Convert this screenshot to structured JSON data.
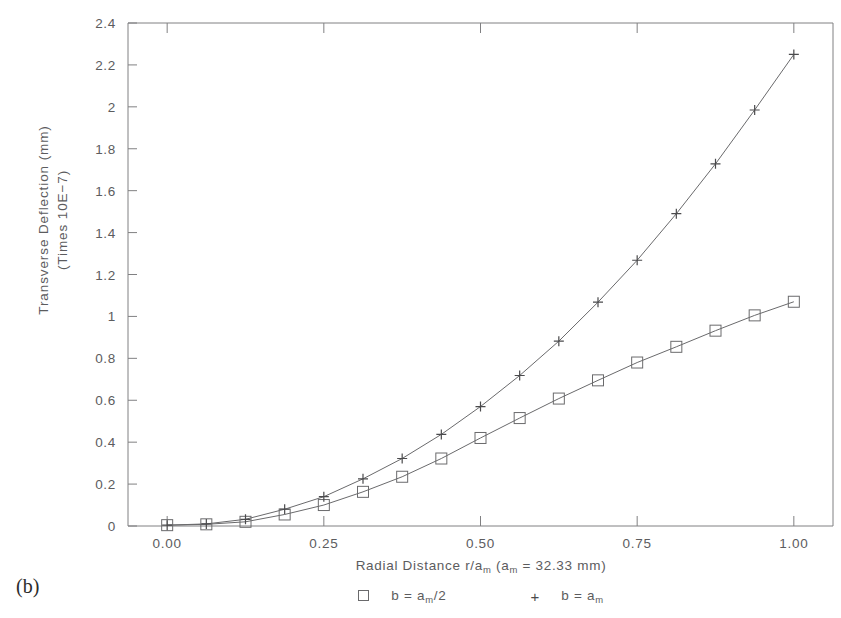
{
  "figure": {
    "panel_label": "(b)"
  },
  "axes": {
    "x_title_parts": {
      "pre": "Radial Distance r/a",
      "sub1": "m",
      "mid": " (a",
      "sub2": "m",
      "post": " = 32.33 mm)"
    },
    "y_title_line1": "Transverse Deflection (mm)",
    "y_title_line2": "(Times 10E−7)",
    "x_ticks": [
      "0.00",
      "0.25",
      "0.50",
      "0.75",
      "1.00"
    ],
    "y_ticks": [
      "0",
      "0.2",
      "0.4",
      "0.6",
      "0.8",
      "1",
      "1.2",
      "1.4",
      "1.6",
      "1.8",
      "2",
      "2.2",
      "2.4"
    ]
  },
  "legend": {
    "entries": [
      {
        "marker": "square-marker",
        "pre": "b = a",
        "sub": "m",
        "post": "/2"
      },
      {
        "marker": "plus-marker",
        "pre": "b = a",
        "sub": "m",
        "post": ""
      }
    ]
  },
  "colors": {
    "line": "#6a6a6c",
    "axis": "#808082",
    "text": "#5c5c5e",
    "background": "#ffffff"
  },
  "chart_data": {
    "type": "line",
    "title": "",
    "xlabel": "Radial Distance r/a_m (a_m = 32.33 mm)",
    "ylabel": "Transverse Deflection (mm) (Times 10E-7)",
    "xlim": [
      -0.0625,
      1.0625
    ],
    "ylim": [
      0,
      2.4
    ],
    "xticks": [
      0.0,
      0.25,
      0.5,
      0.75,
      1.0
    ],
    "yticks": [
      0,
      0.2,
      0.4,
      0.6,
      0.8,
      1.0,
      1.2,
      1.4,
      1.6,
      1.8,
      2.0,
      2.2,
      2.4
    ],
    "grid": false,
    "legend_position": "below-axes",
    "x": [
      0.0,
      0.0625,
      0.125,
      0.1875,
      0.25,
      0.3125,
      0.375,
      0.4375,
      0.5,
      0.5625,
      0.625,
      0.6875,
      0.75,
      0.8125,
      0.875,
      0.9375,
      1.0
    ],
    "series": [
      {
        "name": "b = a_m/2",
        "marker": "square",
        "values": [
          0.004,
          0.008,
          0.02,
          0.055,
          0.1,
          0.163,
          0.235,
          0.322,
          0.42,
          0.515,
          0.608,
          0.695,
          0.78,
          0.855,
          0.932,
          1.005,
          1.07
        ]
      },
      {
        "name": "b = a_m",
        "marker": "plus",
        "values": [
          0.004,
          0.01,
          0.032,
          0.08,
          0.14,
          0.225,
          0.322,
          0.437,
          0.57,
          0.718,
          0.882,
          1.068,
          1.268,
          1.49,
          1.728,
          1.985,
          2.25
        ]
      }
    ]
  }
}
